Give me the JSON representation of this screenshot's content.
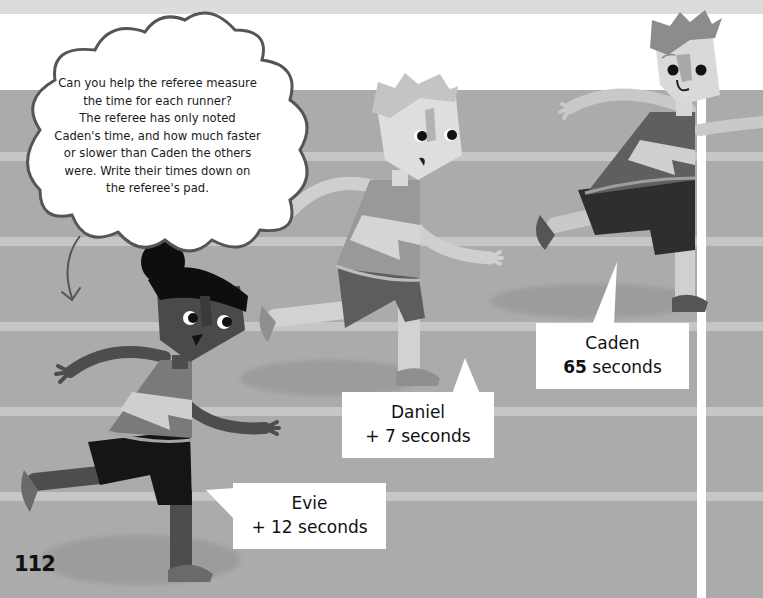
{
  "page": {
    "number": "112",
    "colors": {
      "sky": "#ffffff",
      "top_band": "#dcdcdc",
      "track": "#ababab",
      "lane_line": "#c6c6c6",
      "finish_line": "#ffffff",
      "label_bg": "#ffffff",
      "text": "#111111"
    }
  },
  "thought_cloud": {
    "lines": [
      "Can you help the referee measure",
      "the time for each runner?",
      "The referee has only noted",
      "Caden's time, and how much faster",
      "or slower than Caden the others",
      "were. Write their times down on",
      "the referee's pad."
    ]
  },
  "runners": [
    {
      "name": "Caden",
      "time_value": "65",
      "time_unit": "seconds",
      "time_text": "65 seconds"
    },
    {
      "name": "Daniel",
      "time_value": "+ 7",
      "time_unit": "seconds",
      "time_text": "+ 7 seconds"
    },
    {
      "name": "Evie",
      "time_value": "+ 12",
      "time_unit": "seconds",
      "time_text": "+ 12 seconds"
    }
  ]
}
